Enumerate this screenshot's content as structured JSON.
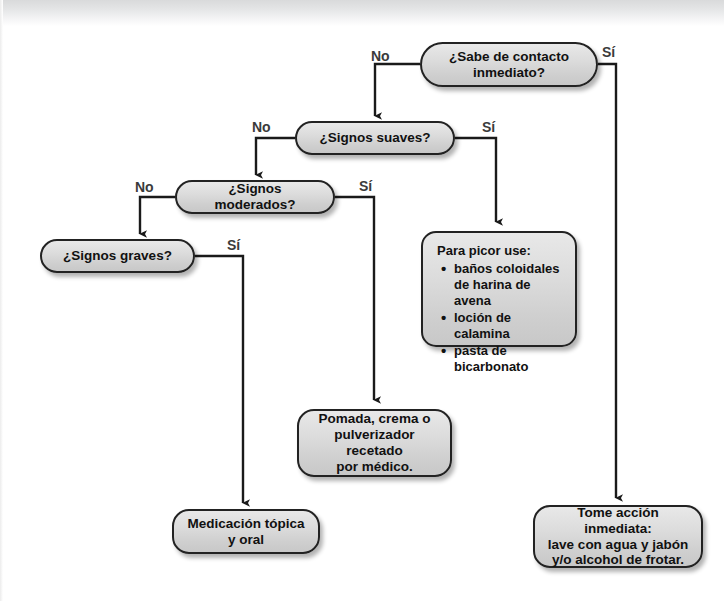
{
  "diagram": {
    "type": "flowchart",
    "language": "es",
    "colors": {
      "node_fill": "#d8d8d8",
      "node_border": "#222222",
      "connector": "#1a1a1a",
      "label_text": "#3b3b3b",
      "page_background": "#ffffff"
    },
    "nodes": [
      {
        "id": "q_contacto",
        "shape": "decision",
        "text": "¿Sabe de contacto inmediato?",
        "lines": [
          "¿Sabe de contacto",
          "inmediato?"
        ]
      },
      {
        "id": "q_suaves",
        "shape": "decision",
        "text": "¿Signos suaves?",
        "lines": [
          "¿Signos suaves?"
        ]
      },
      {
        "id": "q_moderados",
        "shape": "decision",
        "text": "¿Signos moderados?",
        "lines": [
          "¿Signos moderados?"
        ]
      },
      {
        "id": "q_graves",
        "shape": "decision",
        "text": "¿Signos graves?",
        "lines": [
          "¿Signos graves?"
        ]
      },
      {
        "id": "t_picor",
        "shape": "terminal-list",
        "heading": "Para picor use:",
        "items": [
          "baños coloidales de harina de avena",
          "loción de calamina",
          "pasta de bicarbonato"
        ]
      },
      {
        "id": "t_pomada",
        "shape": "terminal",
        "text": "Pomada, crema o pulverizador recetado por  médico.",
        "lines": [
          "Pomada, crema o",
          "pulverizador recetado",
          "por  médico."
        ]
      },
      {
        "id": "t_medicacion",
        "shape": "terminal",
        "text": "Medicación tópica y oral",
        "lines": [
          "Medicación tópica",
          "y oral"
        ]
      },
      {
        "id": "t_inmediata",
        "shape": "terminal",
        "text": "Tome acción inmediata: lave con agua y jabón y/o alcohol de frotar.",
        "lines": [
          "Tome acción inmediata:",
          "lave con agua y jabón",
          "y/o alcohol de frotar."
        ]
      }
    ],
    "edges": [
      {
        "id": "e1",
        "from": "q_contacto",
        "to": "q_suaves",
        "label": "No"
      },
      {
        "id": "e2",
        "from": "q_contacto",
        "to": "t_inmediata",
        "label": "Sí"
      },
      {
        "id": "e3",
        "from": "q_suaves",
        "to": "q_moderados",
        "label": "No"
      },
      {
        "id": "e4",
        "from": "q_suaves",
        "to": "t_picor",
        "label": "Sí"
      },
      {
        "id": "e5",
        "from": "q_moderados",
        "to": "q_graves",
        "label": "No"
      },
      {
        "id": "e6",
        "from": "q_moderados",
        "to": "t_pomada",
        "label": "Sí"
      },
      {
        "id": "e7",
        "from": "q_graves",
        "to": "t_medicacion",
        "label": "Sí"
      }
    ],
    "labels": {
      "no_1": "No",
      "si_1": "Sí",
      "no_2": "No",
      "si_2": "Sí",
      "no_3": "No",
      "si_3": "Sí",
      "si_4": "Sí"
    }
  }
}
